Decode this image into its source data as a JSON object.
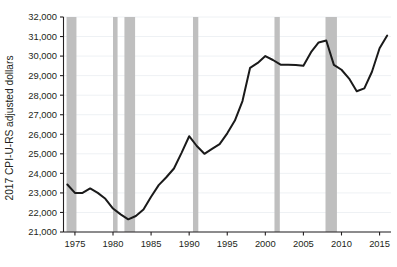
{
  "chart_data": {
    "type": "line",
    "title": "",
    "subtitle": "",
    "xlabel": "",
    "ylabel": "2017 CPI-U-RS adjusted dollars",
    "xlim": [
      1973.5,
      2016.5
    ],
    "ylim": [
      21000,
      32000
    ],
    "grid": true,
    "legend": "none",
    "y_ticks": [
      21000,
      22000,
      23000,
      24000,
      25000,
      26000,
      27000,
      28000,
      29000,
      30000,
      31000,
      32000
    ],
    "y_tick_labels": [
      "21,000",
      "22,000",
      "23,000",
      "24,000",
      "25,000",
      "26,000",
      "27,000",
      "28,000",
      "29,000",
      "30,000",
      "31,000",
      "32,000"
    ],
    "x_ticks": [
      1975,
      1980,
      1985,
      1990,
      1995,
      2000,
      2005,
      2010,
      2015
    ],
    "x_tick_labels": [
      "1975",
      "1980",
      "1985",
      "1990",
      "1995",
      "2000",
      "2005",
      "2010",
      "2015"
    ],
    "series": [
      {
        "name": "Median household income",
        "color": "#1a1a1a",
        "x": [
          1974,
          1975,
          1976,
          1977,
          1978,
          1979,
          1980,
          1981,
          1982,
          1983,
          1984,
          1985,
          1986,
          1987,
          1988,
          1989,
          1990,
          1991,
          1992,
          1993,
          1994,
          1995,
          1996,
          1997,
          1998,
          1999,
          2000,
          2001,
          2002,
          2003,
          2004,
          2005,
          2006,
          2007,
          2008,
          2009,
          2010,
          2011,
          2012,
          2013,
          2014,
          2015,
          2016
        ],
        "values": [
          23430,
          23000,
          23000,
          23230,
          23000,
          22700,
          22200,
          21900,
          21650,
          21820,
          22150,
          22800,
          23400,
          23800,
          24250,
          25050,
          25900,
          25400,
          25000,
          25250,
          25500,
          26050,
          26700,
          27700,
          29400,
          29650,
          30000,
          29800,
          29560,
          29560,
          29550,
          29500,
          30200,
          30700,
          30800,
          29550,
          29300,
          28850,
          28200,
          28350,
          29200,
          30400,
          31050
        ]
      }
    ],
    "recession_bands": [
      {
        "label": "1973-1975 recession",
        "start": 1973.9,
        "end": 1975.2
      },
      {
        "label": "1980 recession",
        "start": 1980.0,
        "end": 1980.6
      },
      {
        "label": "1981-1982 recession",
        "start": 1981.5,
        "end": 1982.9
      },
      {
        "label": "1990-1991 recession",
        "start": 1990.5,
        "end": 1991.2
      },
      {
        "label": "2001 recession",
        "start": 2001.2,
        "end": 2001.9
      },
      {
        "label": "2007-2009 recession",
        "start": 2007.9,
        "end": 2009.4
      }
    ],
    "recession_band_color": "#bfbfbf"
  }
}
